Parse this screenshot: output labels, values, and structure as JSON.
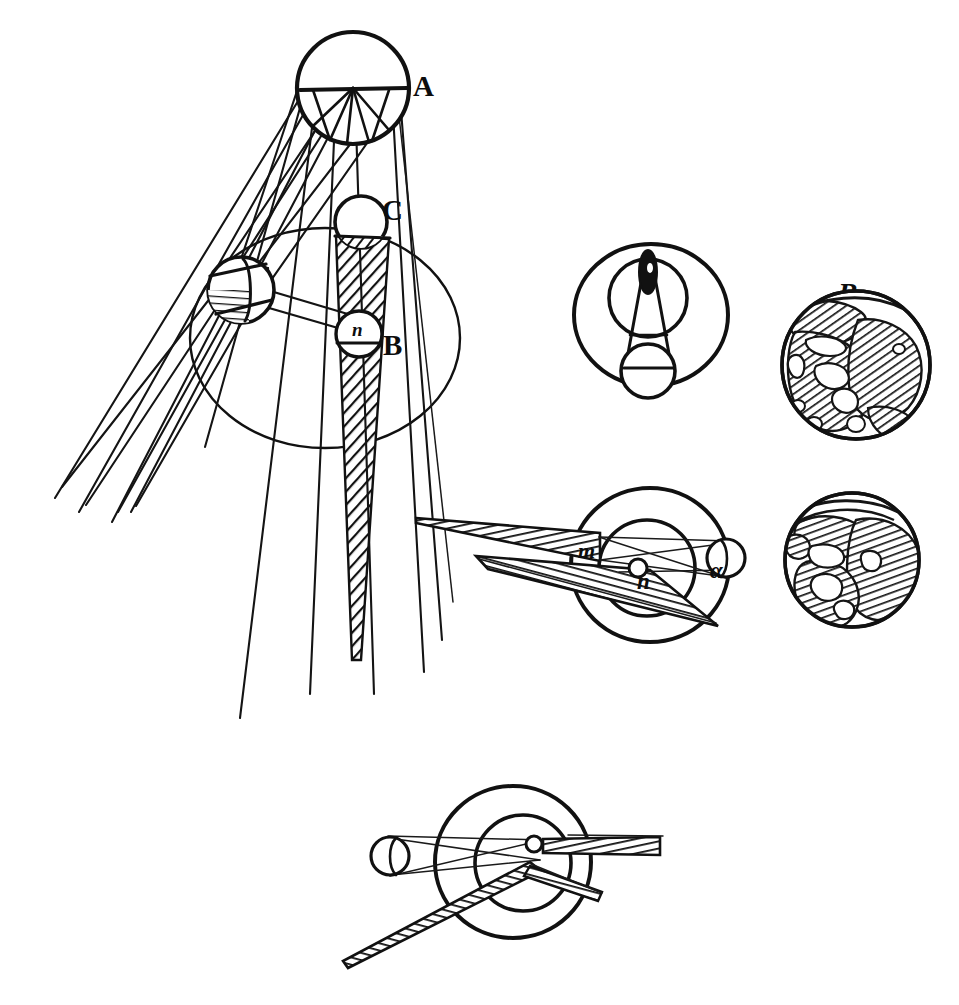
{
  "plate": {
    "title": "Eclipse geometry engraving plate",
    "background_color": "#ffffff",
    "ink_color": "#111111",
    "width": 959,
    "height": 1005
  },
  "labels": {
    "sun_A": "A",
    "moon_C": "C",
    "earth_B": "B",
    "node_n_main": "n",
    "globe_B": "B",
    "point_m": "m",
    "point_n": "n",
    "point_alpha": "α"
  },
  "figures": [
    {
      "id": "main-eclipse-diagram",
      "name": "solar-and-lunar-eclipse-geometry",
      "labels": [
        "A",
        "C",
        "B",
        "n"
      ],
      "elements": [
        "sun-circle-A",
        "moon-circle-C",
        "earth-circle-B",
        "moon-orbit-ellipse",
        "hatched-umbra-cone",
        "penumbra-rays",
        "tangent-ray-bundle",
        "hatched-moon-left"
      ]
    },
    {
      "id": "top-middle-diagram",
      "name": "annular-eclipse-cone-diagram",
      "labels": [],
      "elements": [
        "outer-orbit-circle",
        "inner-orbit-circle",
        "earth-blob",
        "shadow-cone",
        "moon-circle"
      ]
    },
    {
      "id": "globe-upper",
      "name": "earth-globe-upper",
      "labels": [
        "B"
      ],
      "elements": [
        "globe-outline",
        "hatched-continents"
      ]
    },
    {
      "id": "globe-lower",
      "name": "earth-globe-lower",
      "labels": [],
      "elements": [
        "globe-outline",
        "hatched-continents"
      ]
    },
    {
      "id": "middle-right-diagram",
      "name": "lunar-eclipse-shadow-diagram",
      "labels": [
        "m",
        "n",
        "α"
      ],
      "elements": [
        "outer-circle",
        "inner-circle",
        "hatched-cone-left",
        "hatched-cone-lower",
        "small-moon-circle",
        "chord-lines"
      ]
    },
    {
      "id": "bottom-diagram",
      "name": "mirrored-lunar-eclipse-shadow-diagram",
      "labels": [],
      "elements": [
        "outer-circle",
        "inner-circle",
        "hatched-cone-right",
        "hatched-cone-lower-left",
        "small-moon-circle",
        "chord-lines"
      ]
    }
  ]
}
